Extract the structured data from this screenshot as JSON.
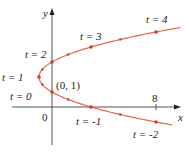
{
  "figure": {
    "axes": {
      "x_label": "x",
      "y_label": "y",
      "origin_label": "0",
      "x_tick_label": "8"
    },
    "point_label": "(0, 1)",
    "parameter_labels": [
      {
        "text": "t = -2",
        "t": -2
      },
      {
        "text": "t = -1",
        "t": -1
      },
      {
        "text": "t = 0",
        "t": 0
      },
      {
        "text": "t = 1",
        "t": 1
      },
      {
        "text": "t = 2",
        "t": 2
      },
      {
        "text": "t = 3",
        "t": 3
      },
      {
        "text": "t = 4",
        "t": 4
      }
    ],
    "colors": {
      "curve": "#e06a4a",
      "points": "#d23a2a",
      "axes": "#555555",
      "text": "#222222"
    }
  },
  "chart_data": {
    "type": "line",
    "title": "",
    "xlabel": "x",
    "ylabel": "y",
    "parametric": "x = t^2 - 2t, y = t + 1",
    "t": [
      -2,
      -1,
      0,
      1,
      2,
      3,
      4
    ],
    "x": [
      8,
      3,
      0,
      -1,
      0,
      3,
      8
    ],
    "y": [
      -1,
      0,
      1,
      2,
      3,
      4,
      5
    ],
    "ticks": {
      "x": [
        8
      ]
    },
    "annotations": [
      "(0,1)",
      "t = -2",
      "t = -1",
      "t = 0",
      "t = 1",
      "t = 2",
      "t = 3",
      "t = 4"
    ]
  }
}
